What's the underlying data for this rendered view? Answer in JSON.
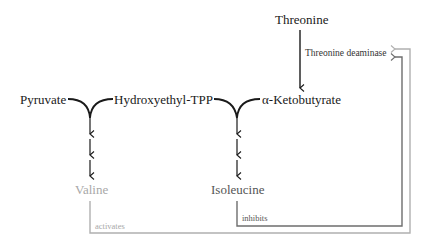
{
  "diagram": {
    "nodes": {
      "threonine": "Threonine",
      "threonine_deaminase": "Threonine deaminase",
      "pyruvate": "Pyruvate",
      "hydroxyethyl_tpp": "Hydroxyethyl-TPP",
      "ketobutyrate": "α-Ketobutyrate",
      "valine": "Valine",
      "isoleucine": "Isoleucine"
    },
    "edges": {
      "activates_label": "activates",
      "inhibits_label": "inhibits"
    },
    "colors": {
      "main": "#1a1a1a",
      "valine": "#a8a8a8",
      "isoleucine": "#555555",
      "activates_line": "#b0b0b0",
      "inhibits_line": "#6e6e6e"
    }
  }
}
